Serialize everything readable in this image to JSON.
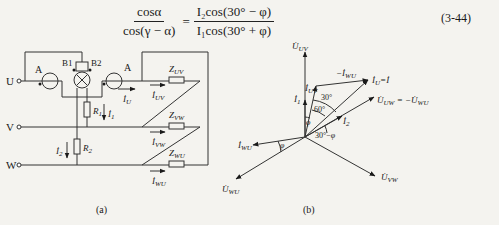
{
  "equation": {
    "lhs_numerator": "cosα",
    "lhs_denominator": "cos(γ − α)",
    "equals": "=",
    "rhs_numerator": "I₂cos(30° − φ)",
    "rhs_denominator": "I₁cos(30° + φ)",
    "number": "(3-44)"
  },
  "circuit": {
    "caption": "(a)",
    "terminals": [
      "U",
      "V",
      "W"
    ],
    "ammeter_label": "A",
    "meter_terminals": [
      "B1",
      "B2"
    ],
    "resistors": [
      "R₁",
      "R₂"
    ],
    "impedances": [
      "Z_UV",
      "Z_VW",
      "Z_WU"
    ],
    "currents": {
      "i_u": "İ_U",
      "i1": "İ₁",
      "i2": "İ₂",
      "i_uv": "İ_UV",
      "i_vw": "İ_VW",
      "i_wu": "İ_WU"
    }
  },
  "phasor": {
    "caption": "(b)",
    "vectors": {
      "u_uv": "U̇_UV",
      "u_vw": "U̇_VW",
      "u_wu": "U̇_WU",
      "u_uw": "U̇_UW = −U̇_WU",
      "i_u": "İ_U = İ",
      "i_uv": "İ_UV",
      "neg_i_wu": "−İ_WU",
      "i_wu": "İ_WU",
      "i1": "İ₁",
      "i2": "İ₂"
    },
    "angles": [
      "30°",
      "60°",
      "φ",
      "30° − φ",
      "φ"
    ]
  }
}
